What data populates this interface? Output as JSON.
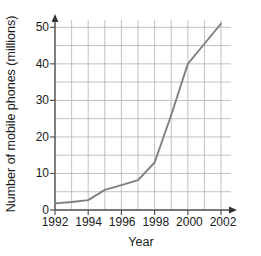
{
  "chart_data": {
    "type": "line",
    "title": "",
    "subtitle": "",
    "xlabel": "Year",
    "ylabel": "Number of mobile phones (millions)",
    "xlim": [
      1992,
      2002.6
    ],
    "ylim": [
      0,
      52
    ],
    "x_ticks": [
      1992,
      1994,
      1996,
      1998,
      2000,
      2002
    ],
    "x_tick_labels": [
      "1992",
      "1994",
      "1996",
      "1998",
      "2000",
      "2002"
    ],
    "y_ticks": [
      0,
      10,
      20,
      30,
      40,
      50
    ],
    "y_tick_labels": [
      "0",
      "10",
      "20",
      "30",
      "40",
      "50"
    ],
    "grid": true,
    "grid_x_step": 1,
    "grid_y_step": 5,
    "legend": false,
    "legend_position": "none",
    "line_color": "#808080",
    "grid_color": "#b3b3b3",
    "axis_color": "#555555",
    "x": [
      1992,
      1993,
      1994,
      1995,
      1996,
      1997,
      1998,
      1999,
      2000,
      2001,
      2002
    ],
    "series": [
      {
        "name": "Mobile phones",
        "values": [
          1.8,
          2.2,
          2.7,
          5.5,
          6.8,
          8.2,
          13.0,
          26.0,
          40.0,
          45.5,
          51.0
        ]
      }
    ],
    "annotations": []
  },
  "axes": {
    "y_title": "Number of mobile phones (millions)",
    "x_title": "Year",
    "y_tick_0": "0",
    "y_tick_1": "10",
    "y_tick_2": "20",
    "y_tick_3": "30",
    "y_tick_4": "40",
    "y_tick_5": "50",
    "x_tick_0": "1992",
    "x_tick_1": "1994",
    "x_tick_2": "1996",
    "x_tick_3": "1998",
    "x_tick_4": "2000",
    "x_tick_5": "2002"
  }
}
